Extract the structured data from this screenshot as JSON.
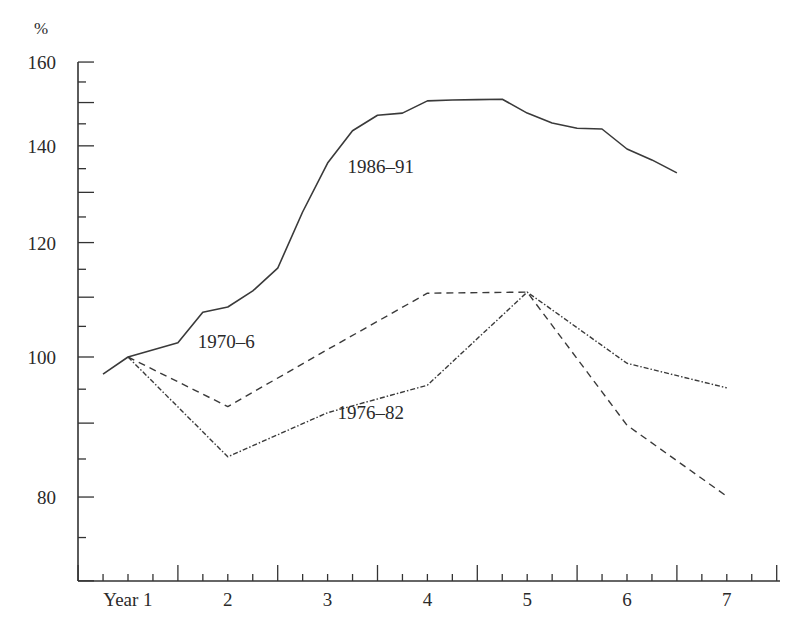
{
  "chart_data": {
    "type": "line",
    "title": "",
    "xlabel": "",
    "ylabel": "%",
    "y_scale": "log",
    "ylim": [
      66,
      160
    ],
    "xlim": [
      0.5,
      7.5
    ],
    "grid": false,
    "legend": "inline labels",
    "x_ticks": [
      {
        "value": 1,
        "label": "Year 1"
      },
      {
        "value": 2,
        "label": "2"
      },
      {
        "value": 3,
        "label": "3"
      },
      {
        "value": 4,
        "label": "4"
      },
      {
        "value": 5,
        "label": "5"
      },
      {
        "value": 6,
        "label": "6"
      },
      {
        "value": 7,
        "label": "7"
      }
    ],
    "y_ticks": [
      {
        "value": 160,
        "label": "160"
      },
      {
        "value": 140,
        "label": "140"
      },
      {
        "value": 120,
        "label": "120"
      },
      {
        "value": 100,
        "label": "100"
      },
      {
        "value": 80,
        "label": "80"
      }
    ],
    "y_minor_ticks": [
      155,
      150,
      145,
      135,
      130,
      125,
      115,
      110,
      105,
      95,
      90,
      85,
      75,
      70
    ],
    "series": [
      {
        "name": "1986–91",
        "style": "solid",
        "label": {
          "text": "1986–91",
          "x": 3.2,
          "y": 134
        },
        "x": [
          0.75,
          1.0,
          1.5,
          1.75,
          2.0,
          2.25,
          2.5,
          2.75,
          3.0,
          3.25,
          3.5,
          3.75,
          4.0,
          4.25,
          4.5,
          4.75,
          5.0,
          5.25,
          5.5,
          5.75,
          6.0,
          6.25,
          6.5
        ],
        "values": [
          97.3,
          100,
          102.3,
          107.4,
          108.3,
          111.1,
          115.2,
          126.0,
          136.2,
          143.4,
          147.0,
          147.5,
          150.4,
          150.6,
          150.7,
          150.8,
          147.5,
          145.2,
          144.0,
          143.8,
          139.3,
          136.9,
          134.1
        ]
      },
      {
        "name": "1970–6",
        "style": "dashed",
        "label": {
          "text": "1970–6",
          "x": 1.7,
          "y": 101.5
        },
        "x": [
          1,
          2,
          3,
          4,
          5,
          6,
          7
        ],
        "values": [
          100,
          92.4,
          101.2,
          110.7,
          110.9,
          89.7,
          80.1
        ]
      },
      {
        "name": "1976–82",
        "style": "dashdot",
        "label": {
          "text": "1976–82",
          "x": 3.1,
          "y": 90.6
        },
        "x": [
          1,
          2,
          3,
          4,
          5,
          6,
          7
        ],
        "values": [
          100,
          85.3,
          91.5,
          95.6,
          110.9,
          99.0,
          95.2
        ]
      }
    ]
  },
  "axis": {
    "unit_label": "%"
  },
  "colors": {
    "line": "#3a3a3a",
    "axis": "#333333",
    "text": "#2a2a2a",
    "background": "#ffffff"
  }
}
